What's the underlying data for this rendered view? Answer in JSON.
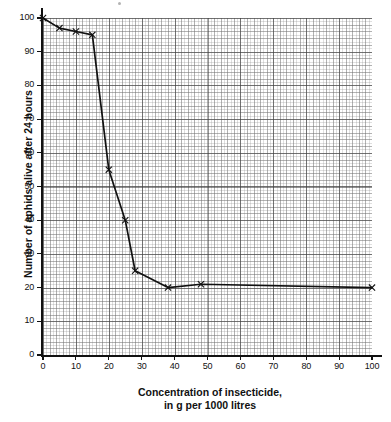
{
  "chart_data": {
    "type": "line",
    "title": "",
    "xlabel": "Concentration of insecticide, in g per 1000 litres",
    "xlabel_lines": [
      "Concentration of insecticide,",
      "in g per 1000 litres"
    ],
    "ylabel": "Number of aphids alive after 24 hours",
    "xlim": [
      0,
      100
    ],
    "ylim": [
      0,
      100
    ],
    "xticks": [
      0,
      10,
      20,
      30,
      40,
      50,
      60,
      70,
      80,
      90,
      100
    ],
    "yticks": [
      0,
      10,
      20,
      30,
      40,
      50,
      60,
      70,
      80,
      90,
      100
    ],
    "grid": true,
    "grid_style": "graph-paper fine 1-unit, medium 2-unit, major 10-unit",
    "legend": false,
    "marker": "x",
    "line_color": "#111111",
    "x": [
      0,
      5,
      10,
      15,
      20,
      25,
      28,
      38,
      48,
      100
    ],
    "values": [
      100,
      97,
      96,
      95,
      55,
      40,
      25,
      20,
      21,
      20
    ],
    "points": [
      {
        "x": 0,
        "y": 100
      },
      {
        "x": 5,
        "y": 97
      },
      {
        "x": 10,
        "y": 96
      },
      {
        "x": 15,
        "y": 95
      },
      {
        "x": 20,
        "y": 55
      },
      {
        "x": 25,
        "y": 40
      },
      {
        "x": 28,
        "y": 25
      },
      {
        "x": 38,
        "y": 20
      },
      {
        "x": 48,
        "y": 21
      },
      {
        "x": 100,
        "y": 20
      }
    ]
  },
  "axes": {
    "x_tick_labels": [
      "0",
      "10",
      "20",
      "30",
      "40",
      "50",
      "60",
      "70",
      "80",
      "90",
      "100"
    ],
    "y_tick_labels": [
      "0",
      "10",
      "20",
      "30",
      "40",
      "50",
      "60",
      "70",
      "80",
      "90",
      "100"
    ],
    "x_title_line1": "Concentration of insecticide,",
    "x_title_line2": "in g per 1000 litres",
    "y_title": "Number of aphids alive after 24 hours"
  }
}
